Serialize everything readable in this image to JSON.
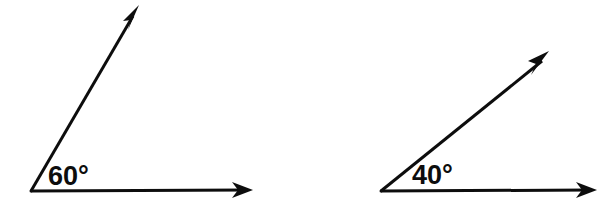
{
  "figure": {
    "background_color": "#ffffff",
    "stroke_color": "#0d0d0d",
    "stroke_width": 3,
    "width": 608,
    "height": 208
  },
  "diagrams": [
    {
      "name": "angle-60",
      "label": "60°",
      "degrees": 60,
      "label_x": 48,
      "label_y": 185,
      "vertex": {
        "x": 31,
        "y": 191
      },
      "rays": [
        {
          "name": "horizontal-ray",
          "from": {
            "x": 31,
            "y": 191
          },
          "to": {
            "x": 253,
            "y": 190
          },
          "direction_degrees": 0,
          "arrow": "arrowhead-right"
        },
        {
          "name": "slanted-ray",
          "from": {
            "x": 31,
            "y": 191
          },
          "to": {
            "x": 139,
            "y": 5
          },
          "direction_degrees": 60,
          "arrow": "arrowhead-up-right"
        }
      ]
    },
    {
      "name": "angle-40",
      "label": "40°",
      "degrees": 40,
      "label_x": 412,
      "label_y": 184,
      "vertex": {
        "x": 381,
        "y": 191
      },
      "rays": [
        {
          "name": "horizontal-ray",
          "from": {
            "x": 381,
            "y": 191
          },
          "to": {
            "x": 597,
            "y": 190
          },
          "direction_degrees": 0,
          "arrow": "arrowhead-right"
        },
        {
          "name": "slanted-ray",
          "from": {
            "x": 381,
            "y": 191
          },
          "to": {
            "x": 549,
            "y": 51
          },
          "direction_degrees": 40,
          "arrow": "arrowhead-up-right"
        }
      ]
    }
  ]
}
